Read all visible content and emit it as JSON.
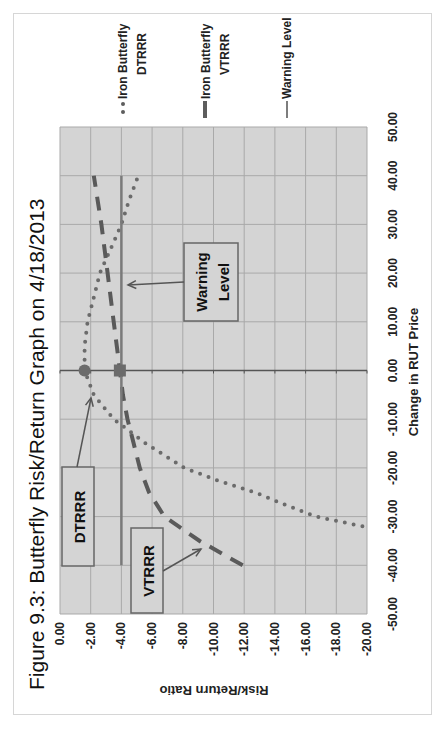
{
  "chart_data": {
    "type": "line",
    "orientation_note": "figure rendered rotated 90 degrees counter-clockwise",
    "title": "Figure 9.3: Butterfly Risk/Return Graph on 4/18/2013",
    "xlabel": "Change in RUT Price",
    "ylabel": "Risk/Return Ratio",
    "xlim": [
      -50,
      50
    ],
    "ylim": [
      -20,
      0
    ],
    "x_ticks": [
      "-50.00",
      "-40.00",
      "-30.00",
      "-20.00",
      "-10.00",
      "0.00",
      "10.00",
      "20.00",
      "30.00",
      "40.00",
      "50.00"
    ],
    "y_ticks": [
      "0.00",
      "-2.00",
      "-4.00",
      "-6.00",
      "-8.00",
      "-10.00",
      "-12.00",
      "-14.00",
      "-16.00",
      "-18.00",
      "-20.00"
    ],
    "grid": true,
    "legend_position": "right",
    "series": [
      {
        "name": "Iron Butterfly DTRRR",
        "style": "dotted",
        "color": "#6b6b6b",
        "x": [
          -32,
          -30,
          -27.5,
          -25,
          -22.5,
          -20,
          -15,
          -10,
          -5,
          0,
          5,
          10,
          15,
          20,
          25,
          30,
          35,
          40
        ],
        "values": [
          -19.7,
          -16.7,
          -14.6,
          -12.7,
          -10.2,
          -8.1,
          -5.6,
          -3.5,
          -2.2,
          -1.6,
          -1.6,
          -1.8,
          -2.2,
          -2.6,
          -3.3,
          -4.0,
          -4.5,
          -5.1
        ]
      },
      {
        "name": "Iron Butterfly VTRRR",
        "style": "dashed",
        "color": "#5a5a5a",
        "x": [
          -40,
          -35,
          -30,
          -25,
          -20,
          -15,
          -10,
          -5,
          0,
          10,
          20,
          30,
          40
        ],
        "values": [
          -11.9,
          -9.1,
          -6.8,
          -5.8,
          -5.2,
          -4.8,
          -4.4,
          -4.1,
          -3.9,
          -3.5,
          -3.1,
          -2.7,
          -2.2
        ]
      },
      {
        "name": "Warning Level",
        "style": "solid",
        "color": "#7a7a7a",
        "x": [
          -40,
          40
        ],
        "values": [
          -4,
          -4
        ]
      }
    ],
    "markers": [
      {
        "series": "Iron Butterfly DTRRR",
        "x": 0,
        "value": -1.6,
        "shape": "circle"
      },
      {
        "series": "Iron Butterfly VTRRR",
        "x": 0,
        "value": -3.9,
        "shape": "square"
      }
    ],
    "annotations": [
      {
        "text": "DTRRR",
        "points_to": {
          "x": -3,
          "value": -2.0
        }
      },
      {
        "text": "VTRRR",
        "points_to": {
          "x": -36,
          "value": -9.3
        }
      },
      {
        "text_lines": [
          "Warning",
          "Level"
        ],
        "points_to": {
          "x": 17,
          "value": -4.0
        }
      }
    ]
  },
  "legend": [
    {
      "line1": "Iron Butterfly",
      "line2": "DTRRR"
    },
    {
      "line1": "Iron Butterfly",
      "line2": "VTRRR"
    },
    {
      "line1": "Warning Level",
      "line2": ""
    }
  ],
  "callouts": {
    "dtrrr": "DTRRR",
    "vtrrr": "VTRRR",
    "warning_line1": "Warning",
    "warning_line2": "Level"
  },
  "colors": {
    "plot_bg": "#d4d4d4",
    "grid": "#a9a9a9",
    "series_dark": "#5d5d5d",
    "warning": "#7d7d7d"
  }
}
